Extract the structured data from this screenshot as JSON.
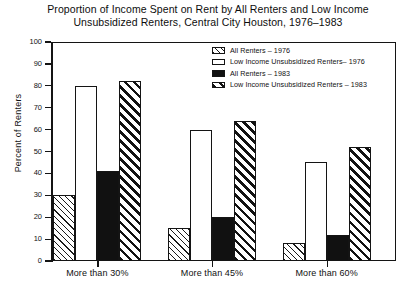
{
  "chart_data": {
    "type": "bar",
    "title": "Proportion of Income Spent on Rent by All Renters and Low Income\nUnsubsidized Renters, Central City Houston, 1976–1983",
    "xlabel": "",
    "ylabel": "Percent of Renters",
    "ylim": [
      0,
      100
    ],
    "ytick_step": 10,
    "grid": false,
    "legend_position": "upper right inside",
    "categories": [
      "More than 30%",
      "More than 45%",
      "More than 60%"
    ],
    "series": [
      {
        "name": "All Renters – 1976",
        "pattern": "hatch-light",
        "values": [
          30,
          15,
          8
        ]
      },
      {
        "name": "Low Income Unsubsidized Renters– 1976",
        "pattern": "white",
        "values": [
          80,
          60,
          45
        ]
      },
      {
        "name": "All Renters – 1983",
        "pattern": "black",
        "values": [
          41,
          20,
          12
        ]
      },
      {
        "name": "Low Income Unsubsidized Renters – 1983",
        "pattern": "hatch-bold",
        "values": [
          82,
          64,
          52
        ]
      }
    ],
    "yticks": [
      "100",
      "90",
      "80",
      "70",
      "60",
      "50",
      "40",
      "30",
      "20",
      "10",
      "0"
    ]
  },
  "colors": {
    "axis": "#141414",
    "text": "#111111",
    "background": "#ffffff",
    "series_black": "#111111"
  }
}
